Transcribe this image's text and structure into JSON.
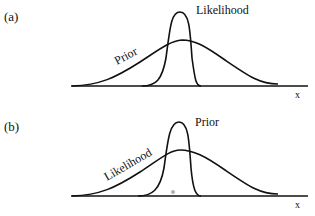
{
  "panels": [
    {
      "label": "(a)",
      "narrow_curve_label": "Likelihood",
      "broad_curve_label": "Prior",
      "axis_label": "x"
    },
    {
      "label": "(b)",
      "narrow_curve_label": "Prior",
      "broad_curve_label": "Likelihood",
      "axis_label": "x",
      "marker": "gray-dot"
    }
  ],
  "colors": {
    "line": "#111111",
    "marker": "#b0b0b0",
    "background": "#ffffff"
  }
}
